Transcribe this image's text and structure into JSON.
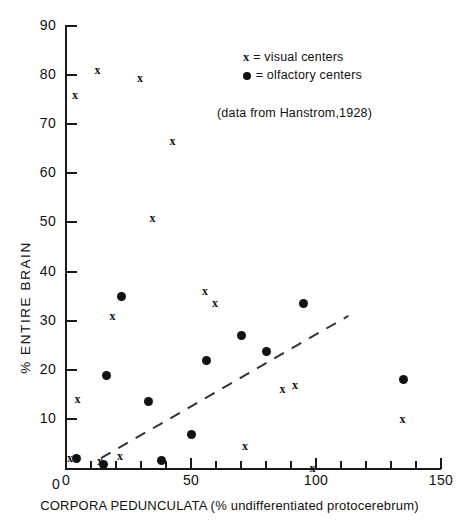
{
  "chart_data": {
    "type": "scatter",
    "title": "",
    "xlabel": "CORPORA PEDUNCULATA (% undifferentiated protocerebrum)",
    "ylabel": "% ENTIRE BRAIN",
    "xlim": [
      0,
      150
    ],
    "ylim": [
      0,
      90
    ],
    "xticks": [
      0,
      50,
      100,
      150
    ],
    "xticks_minor": [
      10,
      20,
      30,
      40,
      60,
      70,
      80,
      90,
      110,
      120,
      130,
      140
    ],
    "yticks": [
      0,
      10,
      20,
      30,
      40,
      50,
      60,
      70,
      80,
      90
    ],
    "ytick_labels": [
      "0",
      "10",
      "20",
      "30",
      "40",
      "50",
      "60",
      "70",
      "80",
      "90"
    ],
    "xtick_labels": [
      "0",
      "50",
      "100",
      "150"
    ],
    "grid": false,
    "legend_position": "upper-right",
    "annotation": "(data from Hanstrom,1928)",
    "series": [
      {
        "name": "visual centers",
        "marker": "x",
        "color": "#111111",
        "points": [
          [
            13,
            81
          ],
          [
            4,
            76
          ],
          [
            30,
            79.5
          ],
          [
            43,
            66.5
          ],
          [
            35,
            51
          ],
          [
            19,
            31
          ],
          [
            56,
            36
          ],
          [
            60,
            33.5
          ],
          [
            5,
            14
          ],
          [
            87,
            16
          ],
          [
            92,
            17
          ],
          [
            135,
            10
          ],
          [
            2,
            2
          ],
          [
            14,
            1.5
          ],
          [
            22,
            2.5
          ],
          [
            72,
            4.5
          ],
          [
            99,
            0
          ]
        ]
      },
      {
        "name": "olfactory centers",
        "marker": "dot",
        "color": "#111111",
        "points": [
          [
            22,
            35
          ],
          [
            16,
            18.8
          ],
          [
            95,
            33.5
          ],
          [
            70,
            27
          ],
          [
            80,
            23.8
          ],
          [
            56,
            21.8
          ],
          [
            135,
            18
          ],
          [
            33,
            13.5
          ],
          [
            50,
            6.8
          ],
          [
            4,
            2
          ],
          [
            15,
            0.8
          ],
          [
            38,
            1.5
          ]
        ]
      }
    ],
    "trendline": {
      "style": "dashed",
      "color": "#333333",
      "x0": 14,
      "y0": 2,
      "x1": 113,
      "y1": 31
    }
  },
  "legend": {
    "items": [
      {
        "marker": "x",
        "text": "= visual centers"
      },
      {
        "marker": "dot",
        "text": "= olfactory centers"
      }
    ],
    "x_marker": "x"
  }
}
